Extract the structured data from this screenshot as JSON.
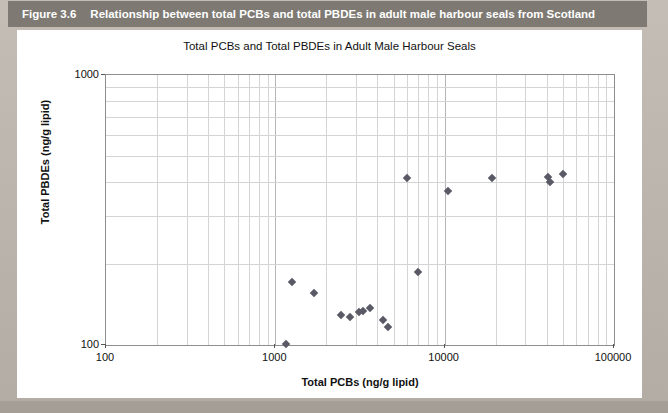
{
  "caption": {
    "figure_number": "Figure 3.6",
    "figure_title": "Relationship between total PCBs and total PBDEs in adult male harbour seals from Scotland"
  },
  "chart_data": {
    "type": "scatter",
    "title": "Total PCBs and Total PBDEs in Adult Male Harbour Seals",
    "xlabel": "Total PCBs (ng/g lipid)",
    "ylabel": "Total PBDEs (ng/g lipid)",
    "xscale": "log",
    "yscale": "log",
    "xlim": [
      100,
      100000
    ],
    "ylim": [
      100,
      1000
    ],
    "x_ticks": [
      "100",
      "1000",
      "10000",
      "100000"
    ],
    "y_ticks": [
      "100",
      "1000"
    ],
    "grid": true,
    "legend": "none",
    "marker": "diamond",
    "marker_color": "#5a5a66",
    "series": [
      {
        "name": "Adult male harbour seals",
        "points": [
          {
            "x": 1150,
            "y": 101
          },
          {
            "x": 1250,
            "y": 171
          },
          {
            "x": 1700,
            "y": 156
          },
          {
            "x": 2450,
            "y": 129
          },
          {
            "x": 2750,
            "y": 127
          },
          {
            "x": 3100,
            "y": 133
          },
          {
            "x": 3300,
            "y": 134
          },
          {
            "x": 3600,
            "y": 137
          },
          {
            "x": 4300,
            "y": 124
          },
          {
            "x": 4600,
            "y": 117
          },
          {
            "x": 6000,
            "y": 415
          },
          {
            "x": 7000,
            "y": 186
          },
          {
            "x": 10500,
            "y": 372
          },
          {
            "x": 19000,
            "y": 415
          },
          {
            "x": 41000,
            "y": 420
          },
          {
            "x": 42000,
            "y": 400
          },
          {
            "x": 50000,
            "y": 430
          }
        ]
      }
    ]
  }
}
